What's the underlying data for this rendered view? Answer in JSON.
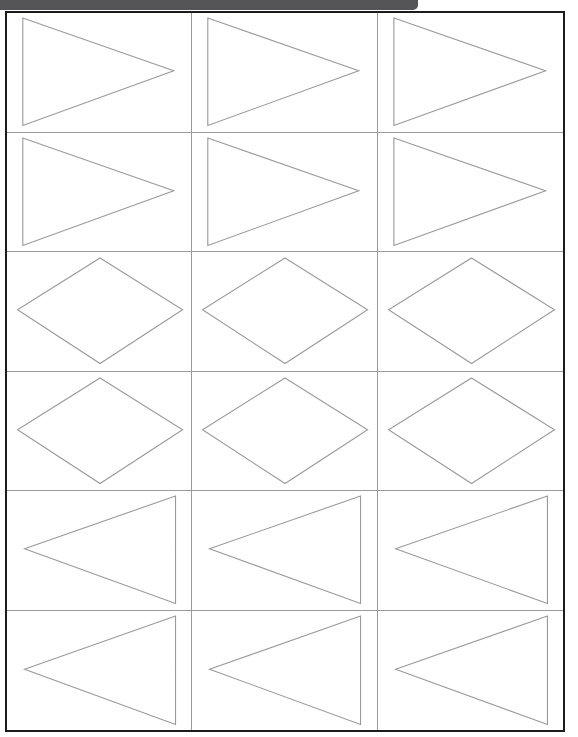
{
  "titlebar": {
    "text": "",
    "color": "#555558"
  },
  "sheet": {
    "border_color": "#1c1c1c",
    "grid_line_color": "#9a9a9a",
    "shape_stroke_color": "#9a9a9a",
    "shape_fill_color": "#ffffff",
    "columns": 3,
    "rows": 6
  },
  "cells": [
    {
      "index": 1,
      "row": 1,
      "col": 1,
      "shape": "triangle-right",
      "label": ""
    },
    {
      "index": 2,
      "row": 1,
      "col": 2,
      "shape": "triangle-right",
      "label": ""
    },
    {
      "index": 3,
      "row": 1,
      "col": 3,
      "shape": "triangle-right",
      "label": ""
    },
    {
      "index": 4,
      "row": 2,
      "col": 1,
      "shape": "triangle-right",
      "label": ""
    },
    {
      "index": 5,
      "row": 2,
      "col": 2,
      "shape": "triangle-right",
      "label": ""
    },
    {
      "index": 6,
      "row": 2,
      "col": 3,
      "shape": "triangle-right",
      "label": ""
    },
    {
      "index": 7,
      "row": 3,
      "col": 1,
      "shape": "rhombus",
      "label": ""
    },
    {
      "index": 8,
      "row": 3,
      "col": 2,
      "shape": "rhombus",
      "label": ""
    },
    {
      "index": 9,
      "row": 3,
      "col": 3,
      "shape": "rhombus",
      "label": ""
    },
    {
      "index": 10,
      "row": 4,
      "col": 1,
      "shape": "rhombus",
      "label": ""
    },
    {
      "index": 11,
      "row": 4,
      "col": 2,
      "shape": "rhombus",
      "label": ""
    },
    {
      "index": 12,
      "row": 4,
      "col": 3,
      "shape": "rhombus",
      "label": ""
    },
    {
      "index": 13,
      "row": 5,
      "col": 1,
      "shape": "triangle-left",
      "label": ""
    },
    {
      "index": 14,
      "row": 5,
      "col": 2,
      "shape": "triangle-left",
      "label": ""
    },
    {
      "index": 15,
      "row": 5,
      "col": 3,
      "shape": "triangle-left",
      "label": ""
    },
    {
      "index": 16,
      "row": 6,
      "col": 1,
      "shape": "triangle-left",
      "label": ""
    },
    {
      "index": 17,
      "row": 6,
      "col": 2,
      "shape": "triangle-left",
      "label": ""
    },
    {
      "index": 18,
      "row": 6,
      "col": 3,
      "shape": "triangle-left",
      "label": ""
    }
  ],
  "shape_geometry": {
    "triangle-right": {
      "points": "9,5 9,113 95,58"
    },
    "triangle-left": {
      "points": "96,5 96,113 10,58"
    },
    "rhombus": {
      "points": "53,6 100,58 53,112 6,58"
    }
  },
  "viewbox": "0 0 105 119"
}
